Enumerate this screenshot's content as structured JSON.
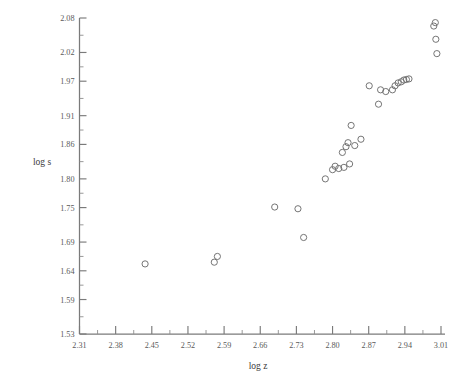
{
  "chart_data": {
    "type": "scatter",
    "title": "",
    "xlabel": "log z",
    "ylabel": "log s",
    "xlim": [
      2.31,
      3.01
    ],
    "ylim": [
      1.53,
      2.08
    ],
    "grid": false,
    "legend": null,
    "xticks": [
      "2.31",
      "2.38",
      "2.45",
      "2.52",
      "2.59",
      "2.66",
      "2.73",
      "2.80",
      "2.87",
      "2.94",
      "3.01"
    ],
    "yticks": [
      "1.53",
      "1.59",
      "1.64",
      "1.69",
      "1.75",
      "1.80",
      "1.86",
      "1.91",
      "1.97",
      "2.02",
      "2.08"
    ],
    "minor_ticks_between": 1,
    "marker": "open-circle",
    "marker_color": "#6e6e6e",
    "points": [
      {
        "x": 2.437,
        "y": 1.652
      },
      {
        "x": 2.571,
        "y": 1.655
      },
      {
        "x": 2.577,
        "y": 1.665
      },
      {
        "x": 2.688,
        "y": 1.751
      },
      {
        "x": 2.733,
        "y": 1.748
      },
      {
        "x": 2.744,
        "y": 1.698
      },
      {
        "x": 2.786,
        "y": 1.8
      },
      {
        "x": 2.8,
        "y": 1.816
      },
      {
        "x": 2.805,
        "y": 1.822
      },
      {
        "x": 2.812,
        "y": 1.818
      },
      {
        "x": 2.819,
        "y": 1.846
      },
      {
        "x": 2.822,
        "y": 1.82
      },
      {
        "x": 2.826,
        "y": 1.856
      },
      {
        "x": 2.83,
        "y": 1.863
      },
      {
        "x": 2.833,
        "y": 1.826
      },
      {
        "x": 2.836,
        "y": 1.893
      },
      {
        "x": 2.843,
        "y": 1.858
      },
      {
        "x": 2.855,
        "y": 1.869
      },
      {
        "x": 2.871,
        "y": 1.962
      },
      {
        "x": 2.889,
        "y": 1.93
      },
      {
        "x": 2.893,
        "y": 1.955
      },
      {
        "x": 2.903,
        "y": 1.952
      },
      {
        "x": 2.916,
        "y": 1.955
      },
      {
        "x": 2.921,
        "y": 1.962
      },
      {
        "x": 2.927,
        "y": 1.967
      },
      {
        "x": 2.933,
        "y": 1.969
      },
      {
        "x": 2.938,
        "y": 1.972
      },
      {
        "x": 2.943,
        "y": 1.973
      },
      {
        "x": 2.948,
        "y": 1.974
      },
      {
        "x": 2.996,
        "y": 2.066
      },
      {
        "x": 2.999,
        "y": 2.072
      },
      {
        "x": 3.0,
        "y": 2.043
      },
      {
        "x": 3.002,
        "y": 2.018
      }
    ]
  }
}
